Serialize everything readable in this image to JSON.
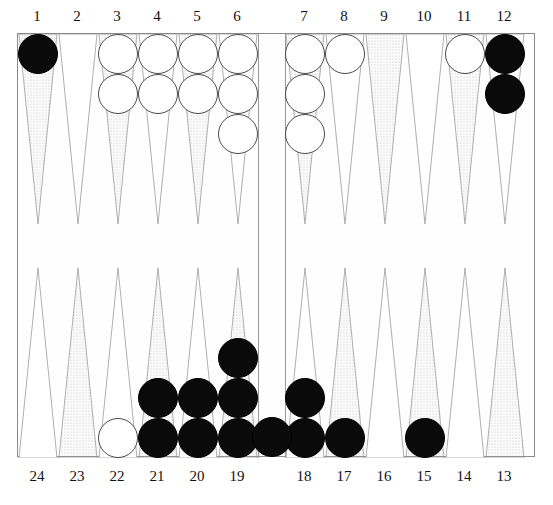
{
  "board": {
    "title": "backgammon-board",
    "geometry": {
      "left": 17,
      "top": 33,
      "width": 518,
      "height": 424,
      "bar_left": 258,
      "bar_width": 27,
      "point_width": 40,
      "point_height": 192,
      "checker_size": 40
    },
    "colors": {
      "background": "#ffffff",
      "board_fill": "#fefefe",
      "frame_line": "#8a8a8a",
      "point_outline": "#9a9a9a",
      "point_shaded_fill": "#e8e8e8",
      "point_plain_fill": "#ffffff",
      "checker_white": "#ffffff",
      "checker_white_border": "#4a4a4a",
      "checker_black": "#0a0a0a",
      "label_text": "#111111"
    }
  },
  "top_labels": [
    "1",
    "2",
    "3",
    "4",
    "5",
    "6",
    "7",
    "8",
    "9",
    "10",
    "11",
    "12"
  ],
  "bottom_labels": [
    "24",
    "23",
    "22",
    "21",
    "20",
    "19",
    "18",
    "17",
    "16",
    "15",
    "14",
    "13"
  ],
  "points": [
    {
      "number": "1",
      "row": "top",
      "slot": 0,
      "quadrant": "top-left",
      "shaded": true,
      "checkers": 1,
      "color": "black"
    },
    {
      "number": "2",
      "row": "top",
      "slot": 1,
      "quadrant": "top-left",
      "shaded": false,
      "checkers": 0,
      "color": null
    },
    {
      "number": "3",
      "row": "top",
      "slot": 2,
      "quadrant": "top-left",
      "shaded": true,
      "checkers": 2,
      "color": "white"
    },
    {
      "number": "4",
      "row": "top",
      "slot": 3,
      "quadrant": "top-left",
      "shaded": false,
      "checkers": 2,
      "color": "white"
    },
    {
      "number": "5",
      "row": "top",
      "slot": 4,
      "quadrant": "top-left",
      "shaded": true,
      "checkers": 2,
      "color": "white"
    },
    {
      "number": "6",
      "row": "top",
      "slot": 5,
      "quadrant": "top-left",
      "shaded": false,
      "checkers": 3,
      "color": "white"
    },
    {
      "number": "7",
      "row": "top",
      "slot": 6,
      "quadrant": "top-right",
      "shaded": true,
      "checkers": 3,
      "color": "white"
    },
    {
      "number": "8",
      "row": "top",
      "slot": 7,
      "quadrant": "top-right",
      "shaded": false,
      "checkers": 1,
      "color": "white"
    },
    {
      "number": "9",
      "row": "top",
      "slot": 8,
      "quadrant": "top-right",
      "shaded": true,
      "checkers": 0,
      "color": null
    },
    {
      "number": "10",
      "row": "top",
      "slot": 9,
      "quadrant": "top-right",
      "shaded": false,
      "checkers": 0,
      "color": null
    },
    {
      "number": "11",
      "row": "top",
      "slot": 10,
      "quadrant": "top-right",
      "shaded": true,
      "checkers": 1,
      "color": "white"
    },
    {
      "number": "12",
      "row": "top",
      "slot": 11,
      "quadrant": "top-right",
      "shaded": false,
      "checkers": 2,
      "color": "black"
    },
    {
      "number": "24",
      "row": "bottom",
      "slot": 0,
      "quadrant": "bottom-left",
      "shaded": false,
      "checkers": 0,
      "color": null
    },
    {
      "number": "23",
      "row": "bottom",
      "slot": 1,
      "quadrant": "bottom-left",
      "shaded": true,
      "checkers": 0,
      "color": null
    },
    {
      "number": "22",
      "row": "bottom",
      "slot": 2,
      "quadrant": "bottom-left",
      "shaded": false,
      "checkers": 1,
      "color": "white"
    },
    {
      "number": "21",
      "row": "bottom",
      "slot": 3,
      "quadrant": "bottom-left",
      "shaded": true,
      "checkers": 2,
      "color": "black"
    },
    {
      "number": "20",
      "row": "bottom",
      "slot": 4,
      "quadrant": "bottom-left",
      "shaded": false,
      "checkers": 2,
      "color": "black"
    },
    {
      "number": "19",
      "row": "bottom",
      "slot": 5,
      "quadrant": "bottom-left",
      "shaded": true,
      "checkers": 3,
      "color": "black"
    },
    {
      "number": "18",
      "row": "bottom",
      "slot": 6,
      "quadrant": "bottom-right",
      "shaded": false,
      "checkers": 2,
      "color": "black"
    },
    {
      "number": "17",
      "row": "bottom",
      "slot": 7,
      "quadrant": "bottom-right",
      "shaded": true,
      "checkers": 1,
      "color": "black"
    },
    {
      "number": "16",
      "row": "bottom",
      "slot": 8,
      "quadrant": "bottom-right",
      "shaded": false,
      "checkers": 0,
      "color": null
    },
    {
      "number": "15",
      "row": "bottom",
      "slot": 9,
      "quadrant": "bottom-right",
      "shaded": true,
      "checkers": 1,
      "color": "black"
    },
    {
      "number": "14",
      "row": "bottom",
      "slot": 10,
      "quadrant": "bottom-right",
      "shaded": false,
      "checkers": 0,
      "color": null
    },
    {
      "number": "13",
      "row": "bottom",
      "slot": 11,
      "quadrant": "bottom-right",
      "shaded": true,
      "checkers": 0,
      "color": null
    }
  ],
  "bar": {
    "top_checkers": 0,
    "top_color": null,
    "bottom_checkers": 1,
    "bottom_color": "black"
  }
}
